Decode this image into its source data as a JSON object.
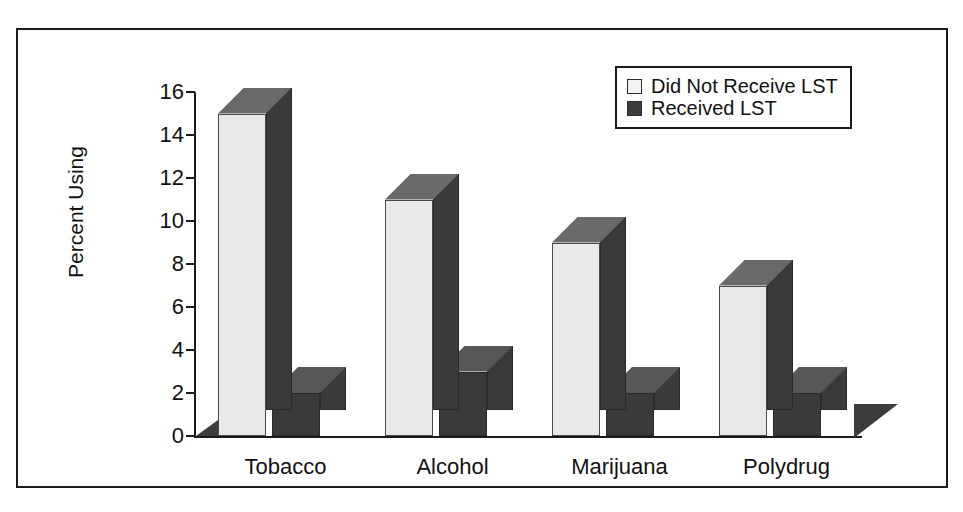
{
  "chart_data": {
    "type": "bar",
    "title": "",
    "xlabel": "",
    "ylabel": "Percent Using",
    "categories": [
      "Tobacco",
      "Alcohol",
      "Marijuana",
      "Polydrug"
    ],
    "series": [
      {
        "name": "Did Not Receive LST",
        "values": [
          15,
          11,
          9,
          7
        ],
        "color": "#e9e9e9"
      },
      {
        "name": "Received LST",
        "values": [
          2,
          3,
          2,
          2
        ],
        "color": "#3a3a3a"
      }
    ],
    "ylim": [
      0,
      16
    ],
    "ytick_values": [
      0,
      2,
      4,
      6,
      8,
      10,
      12,
      14,
      16
    ],
    "ytick_labels": [
      "0",
      "2",
      "4",
      "6",
      "8",
      "10",
      "12",
      "14",
      "16"
    ],
    "grid": false,
    "legend_position": "top-right",
    "style": "3d-grouped-bar"
  },
  "legend": {
    "items": [
      {
        "label": "Did Not Receive LST",
        "swatch": "light-swatch-icon"
      },
      {
        "label": "Received LST",
        "swatch": "dark-swatch-icon"
      }
    ]
  }
}
